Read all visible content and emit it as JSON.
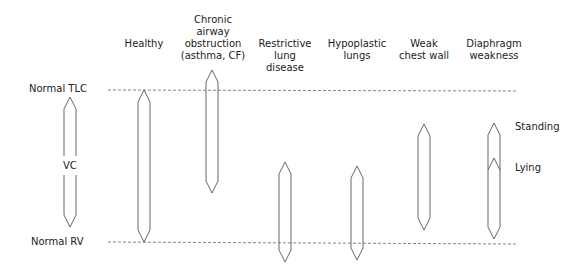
{
  "columns": [
    {
      "label": "Healthy",
      "x": 144
    },
    {
      "label": "Chronic\nairway\nobstruction\n(asthma, CF)",
      "x": 212
    },
    {
      "label": "Restrictive\nlung\ndisease",
      "x": 285
    },
    {
      "label": "Hypoplastic\nlungs",
      "x": 357
    },
    {
      "label": "Weak\nchest wall",
      "x": 424
    },
    {
      "label": "Diaphragm\nweakness",
      "x": 494
    }
  ],
  "reference_lines": {
    "tlc_label": "Normal TLC",
    "rv_label": "Normal RV"
  },
  "legend": {
    "vc_label": "VC"
  },
  "annotations": {
    "standing": "Standing",
    "lying": "Lying"
  },
  "colors": {
    "stroke": "#555555",
    "dash": "#666666",
    "text": "#222222"
  }
}
